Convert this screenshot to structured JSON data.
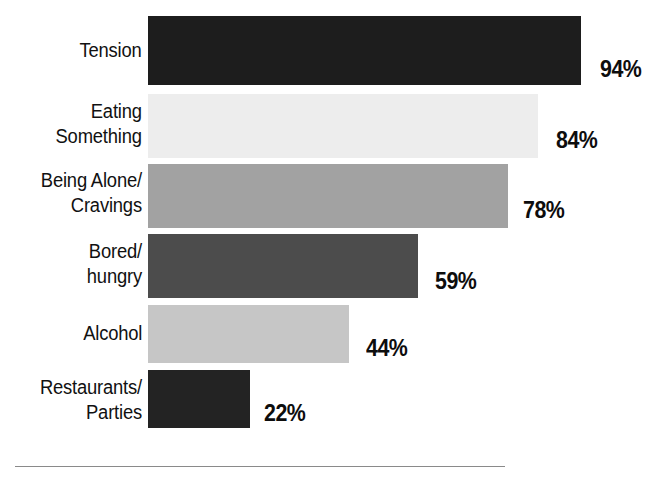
{
  "chart_data": {
    "type": "bar",
    "orientation": "horizontal",
    "title": "",
    "subtitle": "",
    "xlabel": "",
    "ylabel": "",
    "xlim": [
      0,
      100
    ],
    "grid": false,
    "legend": false,
    "value_suffix": "%",
    "categories": [
      "Tension",
      "Eating\nSomething",
      "Being Alone/\nCravings",
      "Bored/\nhungry",
      "Alcohol",
      "Restaurants/\nParties"
    ],
    "values": [
      94,
      84,
      78,
      59,
      44,
      22
    ],
    "value_labels": [
      "94%",
      "84%",
      "78%",
      "59%",
      "44%",
      "22%"
    ],
    "bar_colors": [
      "#1d1d1d",
      "#ededed",
      "#a2a2a2",
      "#4c4c4c",
      "#c6c6c6",
      "#232323"
    ],
    "bars": [
      {
        "category": "Tension",
        "label_text": "Tension",
        "value": 94,
        "value_label": "94%",
        "color": "#1d1d1d",
        "top": 16,
        "height": 69,
        "width": 433,
        "label_top": 38,
        "value_left": 600,
        "value_top": 58
      },
      {
        "category": "Eating Something",
        "label_text": "Eating\nSomething",
        "value": 84,
        "value_label": "84%",
        "color": "#ededed",
        "top": 94,
        "height": 64,
        "width": 390,
        "label_top": 99,
        "value_left": 556,
        "value_top": 129
      },
      {
        "category": "Being Alone/Cravings",
        "label_text": "Being Alone/\nCravings",
        "value": 78,
        "value_label": "78%",
        "color": "#a2a2a2",
        "top": 164,
        "height": 64,
        "width": 360,
        "label_top": 168,
        "value_left": 523,
        "value_top": 199
      },
      {
        "category": "Bored/hungry",
        "label_text": "Bored/\nhungry",
        "value": 59,
        "value_label": "59%",
        "color": "#4c4c4c",
        "top": 234,
        "height": 64,
        "width": 270,
        "label_top": 239,
        "value_left": 435,
        "value_top": 270
      },
      {
        "category": "Alcohol",
        "label_text": "Alcohol",
        "value": 44,
        "value_label": "44%",
        "color": "#c6c6c6",
        "top": 305,
        "height": 58,
        "width": 201,
        "label_top": 321,
        "value_left": 366,
        "value_top": 337
      },
      {
        "category": "Restaurants/Parties",
        "label_text": "Restaurants/\nParties",
        "value": 22,
        "value_label": "22%",
        "color": "#232323",
        "top": 370,
        "height": 58,
        "width": 102,
        "label_top": 375,
        "value_left": 264,
        "value_top": 402
      }
    ],
    "baseline_rule": {
      "left": 15,
      "top": 466,
      "width": 490,
      "color": "#8a8a8a"
    }
  }
}
